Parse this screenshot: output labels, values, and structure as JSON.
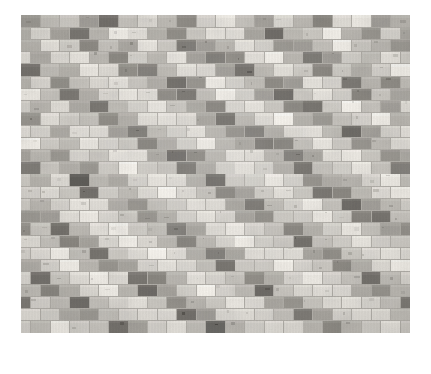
{
  "page": {
    "background_color": "#ffffff",
    "width": 431,
    "height": 374
  },
  "figure": {
    "name": "mosaic-tile-wall-photograph",
    "bounds": {
      "x": 21,
      "y": 15,
      "width": 389,
      "height": 318
    },
    "grid": {
      "columns": 20,
      "rows": 26,
      "tile_width": 19.45,
      "tile_height": 12.23,
      "offset": "half-brick-running-bond"
    },
    "palette": {
      "highlight": "#efece6",
      "light": "#dcd9d3",
      "light_mid": "#c6c3bd",
      "mid": "#aeaba5",
      "mid_dark": "#94918b",
      "dark": "#7b7873",
      "darkest": "#5f5d59",
      "grout": "#b6b3ad"
    }
  },
  "caption": {
    "text": " "
  },
  "chart_data": {
    "type": "heatmap",
    "xlabel": "",
    "ylabel": "",
    "grid": false,
    "legend": "none",
    "note": "Each value is the tonal level of one brick tile: 0 = lightest (#efece6) through 6 = darkest (#5f5d59). Tiles are laid in running bond; odd rows are shifted half a tile to the right.",
    "levels": [
      "#efece6",
      "#dcd9d3",
      "#c6c3bd",
      "#aeaba5",
      "#94918b",
      "#7b7873",
      "#5f5d59"
    ],
    "columns": 20,
    "rows": 26,
    "values": [
      [
        4,
        2,
        1,
        3,
        5,
        2,
        1,
        2,
        4,
        1,
        0,
        2,
        3,
        1,
        2,
        4,
        1,
        0,
        3,
        2
      ],
      [
        1,
        3,
        5,
        2,
        0,
        1,
        3,
        4,
        2,
        0,
        1,
        3,
        5,
        2,
        1,
        0,
        2,
        4,
        1,
        3
      ],
      [
        2,
        0,
        1,
        4,
        2,
        3,
        0,
        1,
        5,
        3,
        2,
        0,
        1,
        4,
        3,
        2,
        0,
        1,
        2,
        4
      ],
      [
        3,
        1,
        0,
        2,
        4,
        1,
        2,
        0,
        3,
        5,
        4,
        1,
        0,
        2,
        5,
        3,
        1,
        2,
        0,
        1
      ],
      [
        5,
        2,
        3,
        0,
        1,
        4,
        5,
        2,
        0,
        1,
        3,
        5,
        2,
        0,
        1,
        4,
        2,
        3,
        1,
        0
      ],
      [
        1,
        4,
        2,
        1,
        0,
        2,
        3,
        5,
        4,
        0,
        1,
        2,
        4,
        3,
        0,
        1,
        5,
        2,
        4,
        2
      ],
      [
        0,
        2,
        5,
        3,
        1,
        0,
        1,
        4,
        5,
        2,
        0,
        1,
        3,
        5,
        2,
        0,
        1,
        4,
        2,
        3
      ],
      [
        2,
        1,
        3,
        5,
        2,
        1,
        0,
        2,
        3,
        4,
        1,
        0,
        2,
        4,
        5,
        1,
        0,
        2,
        3,
        1
      ],
      [
        4,
        0,
        1,
        2,
        4,
        3,
        1,
        0,
        1,
        3,
        5,
        2,
        1,
        0,
        3,
        4,
        2,
        1,
        0,
        2
      ],
      [
        1,
        3,
        0,
        1,
        3,
        5,
        2,
        1,
        0,
        2,
        4,
        5,
        3,
        1,
        0,
        2,
        5,
        3,
        1,
        0
      ],
      [
        0,
        1,
        2,
        0,
        1,
        2,
        4,
        3,
        1,
        0,
        2,
        3,
        5,
        4,
        2,
        0,
        1,
        4,
        2,
        1
      ],
      [
        2,
        4,
        1,
        2,
        0,
        1,
        3,
        5,
        4,
        2,
        0,
        1,
        2,
        5,
        3,
        1,
        0,
        2,
        4,
        3
      ],
      [
        5,
        2,
        3,
        4,
        1,
        0,
        1,
        2,
        5,
        3,
        1,
        0,
        1,
        3,
        5,
        2,
        1,
        0,
        2,
        5
      ],
      [
        3,
        1,
        6,
        2,
        3,
        1,
        0,
        1,
        3,
        5,
        2,
        1,
        0,
        1,
        4,
        3,
        2,
        1,
        0,
        2
      ],
      [
        1,
        0,
        2,
        5,
        1,
        2,
        1,
        0,
        1,
        2,
        4,
        3,
        1,
        0,
        2,
        5,
        4,
        2,
        1,
        0
      ],
      [
        2,
        1,
        0,
        1,
        3,
        4,
        2,
        1,
        0,
        1,
        3,
        5,
        2,
        1,
        0,
        2,
        5,
        3,
        2,
        1
      ],
      [
        4,
        3,
        1,
        0,
        1,
        2,
        4,
        3,
        1,
        0,
        1,
        3,
        4,
        2,
        1,
        0,
        1,
        4,
        5,
        2
      ],
      [
        2,
        5,
        2,
        1,
        0,
        1,
        2,
        5,
        3,
        1,
        0,
        1,
        2,
        4,
        3,
        1,
        0,
        2,
        3,
        4
      ],
      [
        0,
        2,
        4,
        3,
        1,
        0,
        1,
        2,
        4,
        2,
        1,
        0,
        1,
        2,
        5,
        2,
        1,
        0,
        1,
        2
      ],
      [
        1,
        0,
        2,
        5,
        2,
        1,
        0,
        1,
        3,
        5,
        3,
        1,
        0,
        1,
        3,
        4,
        2,
        1,
        0,
        1
      ],
      [
        3,
        1,
        0,
        2,
        4,
        3,
        1,
        0,
        1,
        2,
        5,
        2,
        1,
        0,
        1,
        2,
        4,
        3,
        1,
        0
      ],
      [
        5,
        2,
        1,
        0,
        1,
        5,
        4,
        2,
        0,
        1,
        2,
        4,
        3,
        1,
        0,
        1,
        2,
        5,
        2,
        1
      ],
      [
        2,
        4,
        3,
        1,
        0,
        2,
        5,
        3,
        1,
        0,
        1,
        2,
        5,
        2,
        1,
        0,
        1,
        3,
        4,
        2
      ],
      [
        1,
        2,
        5,
        2,
        1,
        0,
        2,
        4,
        2,
        1,
        0,
        1,
        3,
        4,
        2,
        1,
        0,
        1,
        2,
        5
      ],
      [
        0,
        1,
        3,
        4,
        2,
        1,
        0,
        1,
        5,
        3,
        1,
        0,
        1,
        2,
        5,
        3,
        1,
        0,
        1,
        2
      ],
      [
        2,
        0,
        1,
        2,
        5,
        3,
        1,
        0,
        2,
        6,
        2,
        1,
        0,
        1,
        2,
        4,
        2,
        1,
        0,
        1
      ]
    ]
  }
}
